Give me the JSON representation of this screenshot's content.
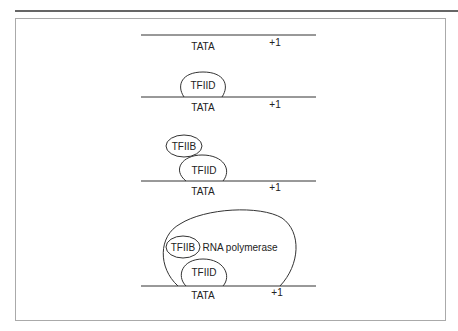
{
  "diagram": {
    "stages": [
      {
        "promoter": "TATA",
        "start_site": "+1"
      },
      {
        "promoter": "TATA",
        "start_site": "+1",
        "factors": [
          "TFIID"
        ]
      },
      {
        "promoter": "TATA",
        "start_site": "+1",
        "factors": [
          "TFIIB",
          "TFIID"
        ]
      },
      {
        "promoter": "TATA",
        "start_site": "+1",
        "factors": [
          "TFIIB",
          "RNA polymerase",
          "TFIID"
        ]
      }
    ],
    "colors": {
      "line": "#333333",
      "frame": "#999999",
      "background": "#ffffff"
    }
  }
}
